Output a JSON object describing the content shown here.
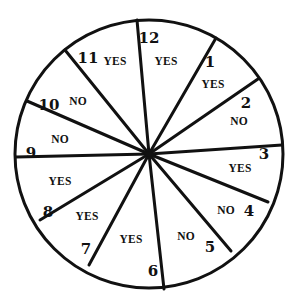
{
  "diagram": {
    "type": "spinner-wheel",
    "center": [
      149,
      154
    ],
    "radius": 134,
    "stroke_color": "#111111",
    "background": "#ffffff",
    "spokes": [
      {
        "number": "12",
        "end": [
          137,
          20
        ],
        "label_pos": [
          149,
          39
        ]
      },
      {
        "number": "1",
        "end": [
          216,
          38
        ],
        "label_pos": [
          210,
          63
        ]
      },
      {
        "number": "2",
        "end": [
          258,
          79
        ],
        "label_pos": [
          246,
          104
        ]
      },
      {
        "number": "3",
        "end": [
          282,
          145
        ],
        "label_pos": [
          264,
          155
        ]
      },
      {
        "number": "4",
        "end": [
          268,
          202
        ],
        "label_pos": [
          249,
          212
        ]
      },
      {
        "number": "5",
        "end": [
          231,
          251
        ],
        "label_pos": [
          210,
          248
        ]
      },
      {
        "number": "6",
        "end": [
          164,
          289
        ],
        "label_pos": [
          153,
          272
        ]
      },
      {
        "number": "7",
        "end": [
          89,
          265
        ],
        "label_pos": [
          86,
          250
        ]
      },
      {
        "number": "8",
        "end": [
          40,
          220
        ],
        "label_pos": [
          48,
          213
        ]
      },
      {
        "number": "9",
        "end": [
          16,
          157
        ],
        "label_pos": [
          31,
          154
        ]
      },
      {
        "number": "10",
        "end": [
          27,
          101
        ],
        "label_pos": [
          49,
          106
        ]
      },
      {
        "number": "11",
        "end": [
          65,
          50
        ],
        "label_pos": [
          88,
          59
        ]
      }
    ],
    "sectors": [
      {
        "between": "12-1",
        "answer": "YES",
        "label_pos": [
          166,
          62
        ]
      },
      {
        "between": "1-2",
        "answer": "YES",
        "label_pos": [
          213,
          85
        ]
      },
      {
        "between": "2-3",
        "answer": "NO",
        "label_pos": [
          239,
          122
        ]
      },
      {
        "between": "3-4",
        "answer": "YES",
        "label_pos": [
          240,
          169
        ]
      },
      {
        "between": "4-5",
        "answer": "NO",
        "label_pos": [
          226,
          211
        ]
      },
      {
        "between": "5-6",
        "answer": "NO",
        "label_pos": [
          186,
          237
        ]
      },
      {
        "between": "6-7",
        "answer": "YES",
        "label_pos": [
          131,
          240
        ]
      },
      {
        "between": "7-8",
        "answer": "YES",
        "label_pos": [
          87,
          217
        ]
      },
      {
        "between": "8-9",
        "answer": "YES",
        "label_pos": [
          60,
          182
        ]
      },
      {
        "between": "9-10",
        "answer": "NO",
        "label_pos": [
          60,
          140
        ]
      },
      {
        "between": "10-11",
        "answer": "NO",
        "label_pos": [
          78,
          102
        ]
      },
      {
        "between": "11-12",
        "answer": "YES",
        "label_pos": [
          115,
          62
        ]
      }
    ]
  }
}
